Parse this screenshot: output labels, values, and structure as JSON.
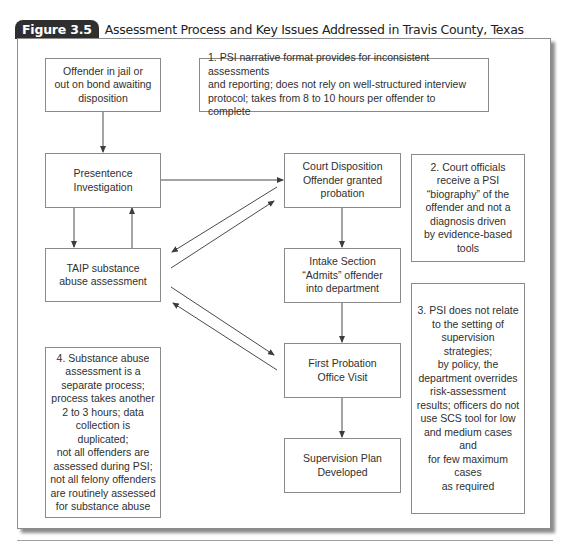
{
  "figure": {
    "label": "Figure 3.5",
    "title": "Assessment Process and Key Issues Addressed in Travis County, Texas"
  },
  "process_steps": {
    "offender_status": "Offender in jail or\nout on bond awaiting\ndisposition",
    "presentence": "Presentence\nInvestigation",
    "taip": "TAIP substance\nabuse assessment",
    "court_disposition": "Court Disposition\nOffender granted\nprobation",
    "intake": "Intake Section\n“Admits” offender\ninto department",
    "first_visit": "First Probation\nOffice Visit",
    "supervision_plan": "Supervision Plan\nDeveloped"
  },
  "issues": {
    "note1": "1. PSI narrative format provides for inconsistent assessments\nand reporting; does not rely on well-structured interview\nprotocol; takes from 8 to 10 hours per offender to complete",
    "note2": "2. Court officials\nreceive a PSI\n“biography” of the\noffender and not a\ndiagnosis driven\nby evidence-based\ntools",
    "note3": "3. PSI does not relate\nto the setting of\nsupervision strategies;\nby policy, the\ndepartment overrides\nrisk-assessment\nresults; officers do not\nuse SCS tool for low\nand medium cases and\nfor few maximum cases\nas required",
    "note4": "4. Substance abuse\nassessment is a\nseparate process;\nprocess takes another\n2 to 3 hours; data\ncollection is duplicated;\nnot all offenders are\nassessed during PSI;\nnot all felony offenders\nare routinely assessed\nfor substance abuse"
  },
  "connections": [
    {
      "from": "offender_status",
      "to": "presentence"
    },
    {
      "from": "presentence",
      "to": "taip"
    },
    {
      "from": "taip",
      "to": "presentence"
    },
    {
      "from": "presentence",
      "to": "court_disposition"
    },
    {
      "from": "court_disposition",
      "to": "taip"
    },
    {
      "from": "taip",
      "to": "court_disposition"
    },
    {
      "from": "court_disposition",
      "to": "intake"
    },
    {
      "from": "intake",
      "to": "first_visit"
    },
    {
      "from": "taip",
      "to": "first_visit"
    },
    {
      "from": "first_visit",
      "to": "taip"
    },
    {
      "from": "first_visit",
      "to": "supervision_plan"
    }
  ],
  "colors": {
    "tab_background": "#2f2f2f",
    "box_border": "#8a8a8a",
    "line": "#4a4a4a"
  }
}
